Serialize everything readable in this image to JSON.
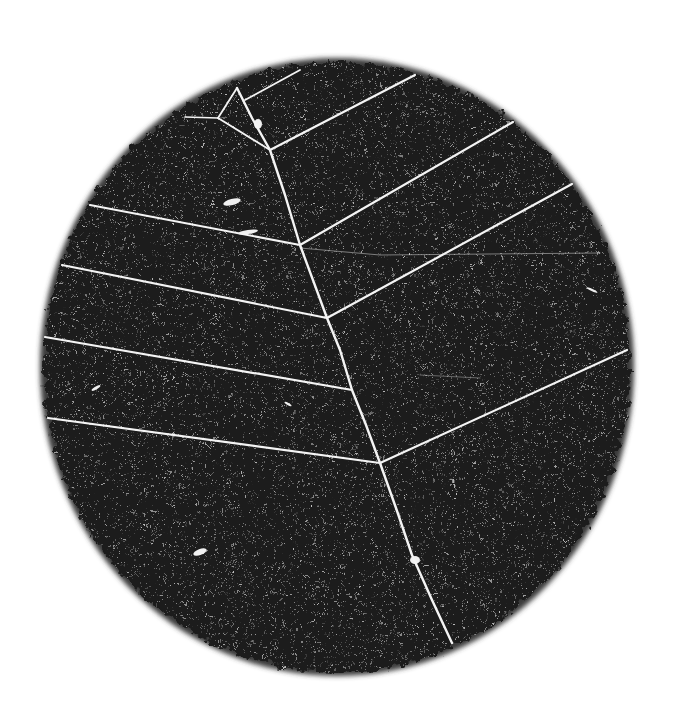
{
  "image": {
    "width": 686,
    "height": 718,
    "background": "#ffffff",
    "description": "Dark circular specimen disc with white branching vein-like lines (leaf-skeleton / track pattern)",
    "disc": {
      "cx": 337,
      "cy": 367,
      "rx": 293,
      "ry": 305,
      "fill": "#1c1c1c",
      "edge_fill": "#3a3a3a"
    },
    "line_color": "#f4f4f4",
    "stem": [
      [
        237,
        88
      ],
      [
        252,
        118
      ],
      [
        270,
        150
      ],
      [
        285,
        195
      ],
      [
        300,
        245
      ],
      [
        327,
        318
      ],
      [
        340,
        350
      ],
      [
        352,
        390
      ],
      [
        366,
        425
      ],
      [
        380,
        463
      ],
      [
        396,
        508
      ],
      [
        412,
        555
      ],
      [
        432,
        600
      ],
      [
        452,
        643
      ]
    ],
    "branches": [
      {
        "name": "upper-right-1",
        "points": [
          [
            270,
            150
          ],
          [
            415,
            75
          ]
        ],
        "width": 2.2
      },
      {
        "name": "upper-right-top",
        "points": [
          [
            245,
            100
          ],
          [
            300,
            70
          ]
        ],
        "width": 1.8
      },
      {
        "name": "right-2",
        "points": [
          [
            300,
            245
          ],
          [
            513,
            122
          ]
        ],
        "width": 2.2
      },
      {
        "name": "right-3",
        "points": [
          [
            327,
            318
          ],
          [
            572,
            184
          ]
        ],
        "width": 2.2
      },
      {
        "name": "right-4",
        "points": [
          [
            380,
            463
          ],
          [
            627,
            350
          ]
        ],
        "width": 2.2
      },
      {
        "name": "left-1",
        "points": [
          [
            90,
            205
          ],
          [
            300,
            245
          ]
        ],
        "width": 2.2
      },
      {
        "name": "left-2",
        "points": [
          [
            62,
            265
          ],
          [
            327,
            318
          ]
        ],
        "width": 2.2
      },
      {
        "name": "left-3",
        "points": [
          [
            45,
            337
          ],
          [
            352,
            390
          ]
        ],
        "width": 2.2
      },
      {
        "name": "left-4",
        "points": [
          [
            48,
            418
          ],
          [
            380,
            463
          ]
        ],
        "width": 2.2
      },
      {
        "name": "upper-left-v-a",
        "points": [
          [
            237,
            88
          ],
          [
            218,
            118
          ]
        ],
        "width": 1.8
      },
      {
        "name": "upper-left-v-b",
        "points": [
          [
            218,
            118
          ],
          [
            185,
            117
          ]
        ],
        "width": 1.6
      },
      {
        "name": "upper-left-v-c",
        "points": [
          [
            218,
            118
          ],
          [
            270,
            150
          ]
        ],
        "width": 1.8
      },
      {
        "name": "faint-mid",
        "points": [
          [
            300,
            248
          ],
          [
            380,
            255
          ],
          [
            600,
            253
          ]
        ],
        "width": 1.0,
        "opacity": 0.45
      },
      {
        "name": "faint-lower",
        "points": [
          [
            420,
            375
          ],
          [
            480,
            378
          ]
        ],
        "width": 1.0,
        "opacity": 0.35
      }
    ],
    "specks": [
      {
        "cx": 232,
        "cy": 202,
        "rx": 9,
        "ry": 3,
        "rot": -15
      },
      {
        "cx": 248,
        "cy": 232,
        "rx": 10,
        "ry": 2,
        "rot": -8
      },
      {
        "cx": 200,
        "cy": 552,
        "rx": 7,
        "ry": 3,
        "rot": -20
      },
      {
        "cx": 258,
        "cy": 124,
        "rx": 4,
        "ry": 5,
        "rot": 0
      },
      {
        "cx": 96,
        "cy": 388,
        "rx": 5,
        "ry": 1.5,
        "rot": -30
      },
      {
        "cx": 288,
        "cy": 404,
        "rx": 4,
        "ry": 1.2,
        "rot": 30
      },
      {
        "cx": 415,
        "cy": 560,
        "rx": 5,
        "ry": 4,
        "rot": 0
      },
      {
        "cx": 592,
        "cy": 290,
        "rx": 6,
        "ry": 1.2,
        "rot": 25
      }
    ]
  }
}
